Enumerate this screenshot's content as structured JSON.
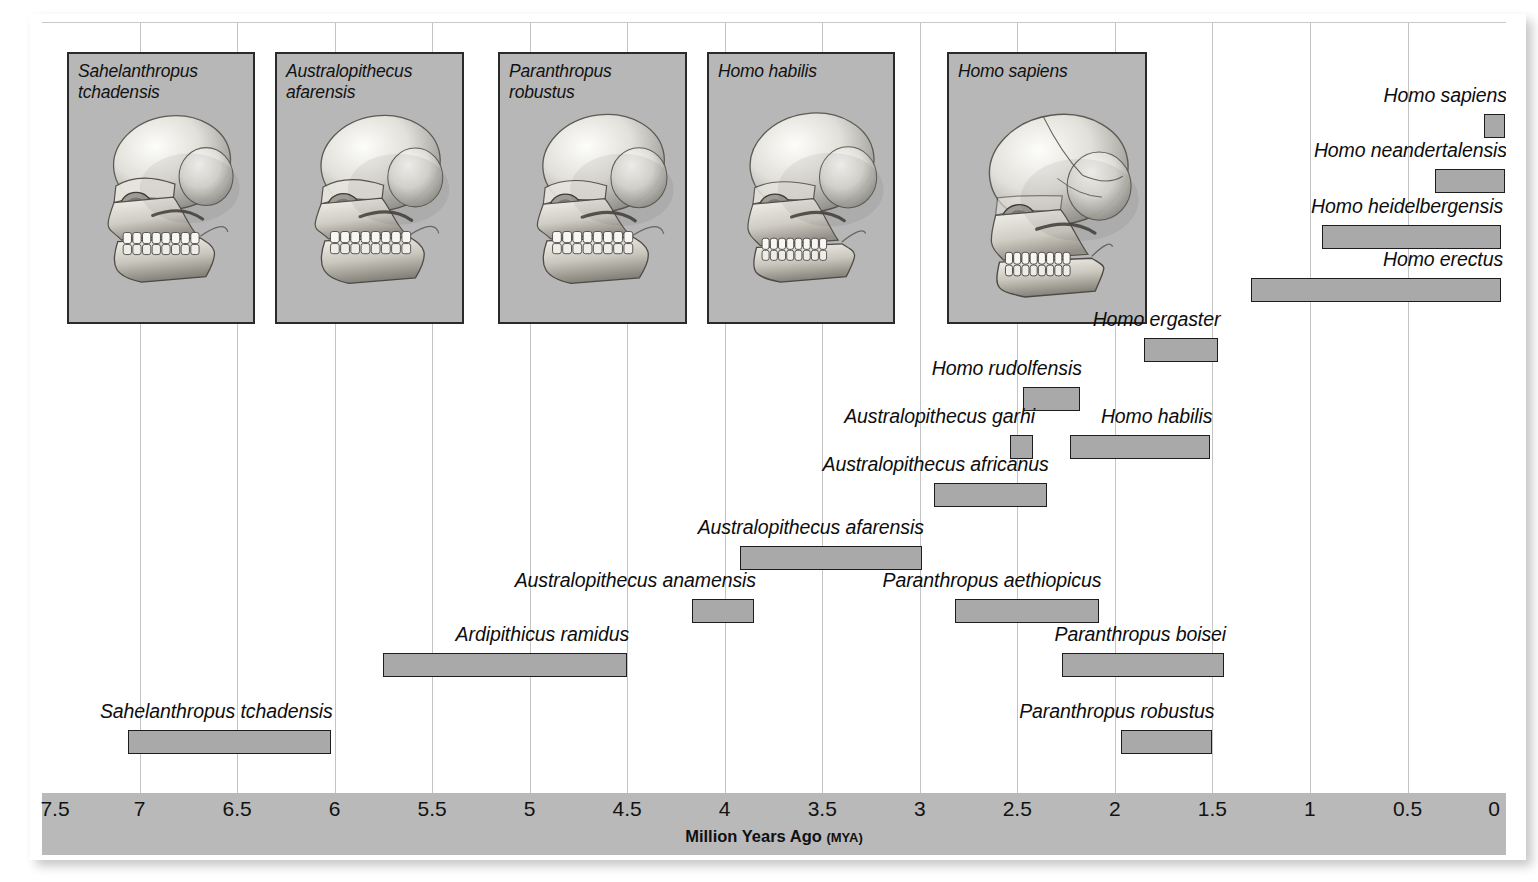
{
  "axis": {
    "title": "Million Years Ago",
    "unit": "(MYA)",
    "ticks": [
      "7.5",
      "7",
      "6.5",
      "6",
      "5.5",
      "5",
      "4.5",
      "4",
      "3.5",
      "3",
      "2.5",
      "2",
      "1.5",
      "1",
      "0.5",
      "0"
    ],
    "min": 0,
    "max": 7.5,
    "direction": "right-to-left-decreasing"
  },
  "skull_panels": [
    {
      "name": "Sahelanthropus\ntchadensis",
      "id": "sahelanthropus-tchadensis"
    },
    {
      "name": "Australopithecus\nafarensis",
      "id": "australopithecus-afarensis"
    },
    {
      "name": "Paranthropus\nrobustus",
      "id": "paranthropus-robustus"
    },
    {
      "name": "Homo habilis",
      "id": "homo-habilis"
    },
    {
      "name": "Homo sapiens",
      "id": "homo-sapiens"
    }
  ],
  "chart_data": {
    "type": "bar",
    "orientation": "horizontal-range",
    "title": "",
    "xlabel": "Million Years Ago (MYA)",
    "ylabel": "",
    "xlim": [
      7.5,
      0
    ],
    "grid": true,
    "legend": "none",
    "units": "million years ago",
    "categories": [
      "Homo sapiens",
      "Homo neandertalensis",
      "Homo heidelbergensis",
      "Homo erectus",
      "Homo ergaster",
      "Homo rudolfensis",
      "Australopithecus garhi",
      "Homo habilis",
      "Australopithecus africanus",
      "Australopithecus afarensis",
      "Australopithecus anamensis",
      "Paranthropus aethiopicus",
      "Ardipithicus ramidus",
      "Paranthropus boisei",
      "Sahelanthropus tchadensis",
      "Paranthropus robustus"
    ],
    "ranges": [
      {
        "label": "Homo sapiens",
        "start": 0.11,
        "end": 0.0
      },
      {
        "label": "Homo neandertalensis",
        "start": 0.36,
        "end": 0.0
      },
      {
        "label": "Homo heidelbergensis",
        "start": 0.94,
        "end": 0.02
      },
      {
        "label": "Homo erectus",
        "start": 1.3,
        "end": 0.02
      },
      {
        "label": "Homo ergaster",
        "start": 1.85,
        "end": 1.47
      },
      {
        "label": "Homo rudolfensis",
        "start": 2.47,
        "end": 2.18
      },
      {
        "label": "Australopithecus garhi",
        "start": 2.54,
        "end": 2.42
      },
      {
        "label": "Homo habilis",
        "start": 2.23,
        "end": 1.51
      },
      {
        "label": "Australopithecus africanus",
        "start": 2.93,
        "end": 2.35
      },
      {
        "label": "Australopithecus afarensis",
        "start": 3.92,
        "end": 2.99
      },
      {
        "label": "Australopithecus anamensis",
        "start": 4.17,
        "end": 3.85
      },
      {
        "label": "Paranthropus aethiopicus",
        "start": 2.82,
        "end": 2.08
      },
      {
        "label": "Ardipithicus ramidus",
        "start": 5.75,
        "end": 4.5
      },
      {
        "label": "Paranthropus boisei",
        "start": 2.27,
        "end": 1.44
      },
      {
        "label": "Sahelanthropus tchadensis",
        "start": 7.06,
        "end": 6.02
      },
      {
        "label": "Paranthropus robustus",
        "start": 1.97,
        "end": 1.5
      }
    ]
  },
  "bars": [
    {
      "label": "Homo sapiens",
      "start": 0.11,
      "end": 0.0,
      "row": 0,
      "label_side": "left"
    },
    {
      "label": "Homo neandertalensis",
      "start": 0.36,
      "end": 0.0,
      "row": 1,
      "label_side": "left"
    },
    {
      "label": "Homo heidelbergensis",
      "start": 0.94,
      "end": 0.02,
      "row": 2,
      "label_side": "left"
    },
    {
      "label": "Homo erectus",
      "start": 1.3,
      "end": 0.02,
      "row": 3,
      "label_side": "left"
    },
    {
      "label": "Homo ergaster",
      "start": 1.85,
      "end": 1.47,
      "row": 4,
      "label_side": "left"
    },
    {
      "label": "Homo rudolfensis",
      "start": 2.47,
      "end": 2.18,
      "row": 5,
      "label_side": "left"
    },
    {
      "label": "Australopithecus garhi",
      "start": 2.54,
      "end": 2.42,
      "row": 6,
      "label_side": "left"
    },
    {
      "label": "Homo habilis",
      "start": 2.23,
      "end": 1.51,
      "row": 6,
      "label_side": "left"
    },
    {
      "label": "Australopithecus africanus",
      "start": 2.93,
      "end": 2.35,
      "row": 7,
      "label_side": "left"
    },
    {
      "label": "Australopithecus afarensis",
      "start": 3.92,
      "end": 2.99,
      "row": 8,
      "label_side": "left"
    },
    {
      "label": "Australopithecus anamensis",
      "start": 4.17,
      "end": 3.85,
      "row": 9,
      "label_side": "left"
    },
    {
      "label": "Paranthropus aethiopicus",
      "start": 2.82,
      "end": 2.08,
      "row": 9,
      "label_side": "left"
    },
    {
      "label": "Ardipithicus ramidus",
      "start": 5.75,
      "end": 4.5,
      "row": 10,
      "label_side": "left"
    },
    {
      "label": "Paranthropus boisei",
      "start": 2.27,
      "end": 1.44,
      "row": 10,
      "label_side": "left"
    },
    {
      "label": "Sahelanthropus tchadensis",
      "start": 7.06,
      "end": 6.02,
      "row": 11,
      "label_side": "left"
    },
    {
      "label": "Paranthropus robustus",
      "start": 1.97,
      "end": 1.5,
      "row": 11,
      "label_side": "left"
    }
  ],
  "colors": {
    "bar_fill": "#a9a9a9",
    "bar_border": "#1d1d1d",
    "panel_fill": "#b7b7b7",
    "panel_border": "#2a2a2a",
    "axis_strip": "#b9b9b9",
    "gridline": "#c4c4c4",
    "page": "#ffffff",
    "text": "#101010"
  }
}
